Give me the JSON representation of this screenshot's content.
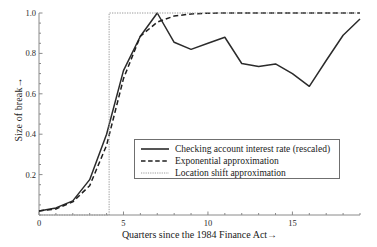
{
  "chart_data": {
    "type": "line",
    "title": "",
    "xlabel": "Quarters since the 1984 Finance Act→",
    "ylabel": "Size of break→",
    "xlim": [
      0,
      19
    ],
    "ylim": [
      0,
      1.0
    ],
    "grid": false,
    "legend_position": "center",
    "xticks": [
      "0",
      "5",
      "10",
      "15"
    ],
    "xtick_values": [
      0,
      5,
      10,
      15
    ],
    "yticks": [
      "0.2",
      "0.4",
      "0.6",
      "0.8",
      "1.0"
    ],
    "ytick_values": [
      0.2,
      0.4,
      0.6,
      0.8,
      1.0
    ],
    "x": [
      0,
      1,
      2,
      3,
      4,
      5,
      6,
      7,
      8,
      9,
      10,
      11,
      12,
      13,
      14,
      15,
      16,
      17,
      18,
      19
    ],
    "series": [
      {
        "name": "Checking account interest rate (rescaled)",
        "style": "solid",
        "color": "#2b2b2b",
        "values": [
          0.02,
          0.035,
          0.07,
          0.175,
          0.4,
          0.715,
          0.885,
          1.0,
          0.855,
          0.82,
          0.85,
          0.88,
          0.75,
          0.735,
          0.748,
          0.7,
          0.637,
          0.765,
          0.89,
          0.97
        ]
      },
      {
        "name": "Exponential approximation",
        "style": "dashed",
        "color": "#1f1f1f",
        "values": [
          0.02,
          0.03,
          0.065,
          0.145,
          0.345,
          0.675,
          0.885,
          0.955,
          0.985,
          0.995,
          0.999,
          1.0,
          1.0,
          1.0,
          1.0,
          1.0,
          1.0,
          1.0,
          1.0,
          1.0
        ]
      },
      {
        "name": "Location shift approximation",
        "style": "dotted",
        "color": "#9a9a9a",
        "values": [
          0.0,
          0.0,
          0.0,
          0.0,
          0.0,
          1.0,
          1.0,
          1.0,
          1.0,
          1.0,
          1.0,
          1.0,
          1.0,
          1.0,
          1.0,
          1.0,
          1.0,
          1.0,
          1.0,
          1.0
        ],
        "step_at": 4.15
      }
    ]
  },
  "legend": {
    "items": [
      {
        "label": "Checking account interest rate (rescaled)",
        "style": "solid"
      },
      {
        "label": "Exponential approximation",
        "style": "dashed"
      },
      {
        "label": "Location shift approximation",
        "style": "dotted"
      }
    ]
  },
  "axes": {
    "ylabel": "Size of break→",
    "xlabel": "Quarters since the 1984 Finance Act→"
  },
  "colors": {
    "axis": "#8a8a8a",
    "series_solid": "#2b2b2b",
    "series_dashed": "#1f1f1f",
    "series_dotted": "#9a9a9a",
    "text": "#1a1a1a",
    "background": "#ffffff"
  }
}
